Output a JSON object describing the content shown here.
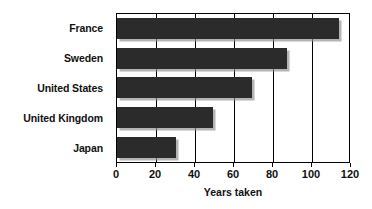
{
  "chart_data": {
    "type": "bar",
    "orientation": "horizontal",
    "title": "",
    "subtitle": "",
    "categories": [
      "France",
      "Sweden",
      "United States",
      "United Kingdom",
      "Japan"
    ],
    "values": [
      114,
      87,
      69,
      49,
      30
    ],
    "series": [
      {
        "name": "Years taken",
        "values": [
          114,
          87,
          69,
          49,
          30
        ]
      }
    ],
    "xlabel": "Years taken",
    "ylabel": "",
    "xlim": [
      0,
      120
    ],
    "xticks": [
      0,
      20,
      40,
      60,
      80,
      100,
      120
    ],
    "xtick_labels": [
      "0",
      "20",
      "40",
      "60",
      "80",
      "100",
      "120"
    ],
    "grid": "vertical",
    "legend": "none",
    "bar_color": "#2b2b2b",
    "shadow_color": "#8c8c8c",
    "plot_background": "#ffffff",
    "axis_color": "#000000",
    "text_color": "#111111"
  }
}
